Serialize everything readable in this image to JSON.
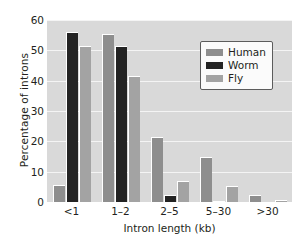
{
  "chart_data": {
    "type": "bar",
    "title": "",
    "xlabel": "Intron length (kb)",
    "ylabel": "Percentage of introns",
    "categories": [
      "<1",
      "1–2",
      "2–5",
      "5–30",
      ">30"
    ],
    "series": [
      {
        "name": "Human",
        "color": "#8e8e8e",
        "values": [
          5.5,
          55.5,
          21.5,
          15.0,
          2.3
        ]
      },
      {
        "name": "Worm",
        "color": "#232323",
        "values": [
          56.0,
          51.5,
          2.3,
          0.4,
          0.0
        ]
      },
      {
        "name": "Fly",
        "color": "#a3a3a3",
        "values": [
          51.5,
          41.5,
          6.8,
          5.2,
          0.5
        ]
      }
    ],
    "ylim": [
      0,
      60
    ],
    "yticks": [
      0,
      10,
      20,
      30,
      40,
      50,
      60
    ],
    "ytick_labels": [
      "0",
      "10",
      "20",
      "30",
      "40",
      "50",
      "60"
    ],
    "grid": true,
    "grid_axis": "y",
    "legend_position": "top-right",
    "plot_background": "#d9d9d9",
    "gridline_color": "#f4f4f4"
  }
}
